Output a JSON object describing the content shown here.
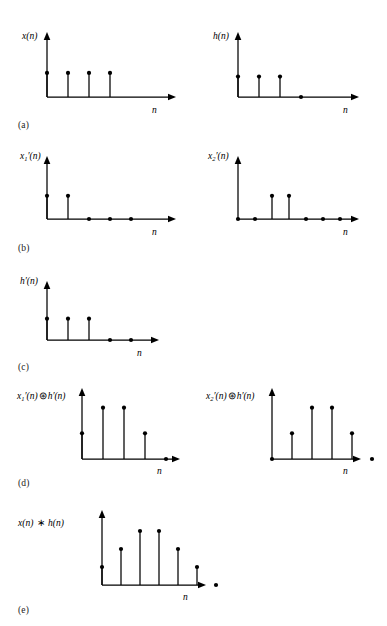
{
  "figure": {
    "axis_label": "n",
    "stem_color": "#000000",
    "background": "#ffffff"
  },
  "panels": [
    {
      "id": "a",
      "label": "(a)",
      "plots": [
        {
          "name": "x(n)",
          "label_html": "x(n)",
          "axis_label": "n",
          "values": [
            1,
            1,
            1,
            1
          ],
          "n_points": 4,
          "ymax": 2.2,
          "zero_markers": []
        },
        {
          "name": "h(n)",
          "label_html": "h(n)",
          "axis_label": "n",
          "values": [
            1,
            1,
            1,
            0
          ],
          "n_points": 4,
          "ymax": 2.6,
          "zero_markers": [
            3
          ]
        }
      ]
    },
    {
      "id": "b",
      "label": "(b)",
      "plots": [
        {
          "name": "x1'(n)",
          "label_html": "x<sub>1</sub>&#8242;(n)",
          "axis_label": "n",
          "values": [
            1,
            1,
            0,
            0,
            0
          ],
          "n_points": 5,
          "ymax": 2.2,
          "zero_markers": [
            2,
            3,
            4
          ]
        },
        {
          "name": "x2'(n)",
          "label_html": "x<sub>2</sub>&#8242;(n)",
          "axis_label": "n",
          "values": [
            0,
            0,
            1,
            1,
            0,
            0,
            0
          ],
          "n_points": 7,
          "ymax": 2.2,
          "zero_markers": [
            0,
            1,
            4,
            5,
            6
          ]
        }
      ]
    },
    {
      "id": "c",
      "label": "(c)",
      "plots": [
        {
          "name": "h'(n)",
          "label_html": "h&#8242;(n)",
          "axis_label": "n",
          "values": [
            1,
            1,
            1,
            0,
            0
          ],
          "n_points": 5,
          "ymax": 2.2,
          "zero_markers": [
            3,
            4
          ]
        }
      ]
    },
    {
      "id": "d",
      "label": "(d)",
      "plots": [
        {
          "name": "x1'(n) circconv h'(n)",
          "label_html": "x<sub>1</sub>&#8242;(n)<span class=\"op\">&#8859;</span>h&#8242;(n)",
          "axis_label": "n",
          "values": [
            1,
            2,
            2,
            1,
            0
          ],
          "n_points": 5,
          "ymax": 2.3,
          "zero_markers": [
            4
          ]
        },
        {
          "name": "x2'(n) circconv h'(n)",
          "label_html": "x<sub>2</sub>&#8242;(n)<span class=\"op\">&#8859;</span>h&#8242;(n)",
          "axis_label": "n",
          "values": [
            0,
            1,
            2,
            2,
            1,
            0
          ],
          "n_points": 6,
          "ymax": 2.3,
          "zero_markers": [
            0,
            5
          ]
        }
      ]
    },
    {
      "id": "e",
      "label": "(e)",
      "plots": [
        {
          "name": "x(n) conv h(n)",
          "label_html": "x(n) <span class=\"op\">&#8727;</span> h(n)",
          "axis_label": "n",
          "values": [
            1,
            2,
            3,
            3,
            2,
            1,
            0
          ],
          "n_points": 7,
          "ymax": 3.5,
          "zero_markers": [
            6
          ]
        }
      ]
    }
  ],
  "chart_data": {
    "type": "stem",
    "xlabel": "n",
    "ylabel": "",
    "grid": false,
    "legend": "none",
    "subplots": [
      {
        "panel": "a",
        "series": "x(n)",
        "x": [
          0,
          1,
          2,
          3
        ],
        "values": [
          1,
          1,
          1,
          1
        ]
      },
      {
        "panel": "a",
        "series": "h(n)",
        "x": [
          0,
          1,
          2,
          3
        ],
        "values": [
          1,
          1,
          1,
          0
        ]
      },
      {
        "panel": "b",
        "series": "x1'(n)",
        "x": [
          0,
          1,
          2,
          3,
          4
        ],
        "values": [
          1,
          1,
          0,
          0,
          0
        ]
      },
      {
        "panel": "b",
        "series": "x2'(n)",
        "x": [
          0,
          1,
          2,
          3,
          4,
          5,
          6
        ],
        "values": [
          0,
          0,
          1,
          1,
          0,
          0,
          0
        ]
      },
      {
        "panel": "c",
        "series": "h'(n)",
        "x": [
          0,
          1,
          2,
          3,
          4
        ],
        "values": [
          1,
          1,
          1,
          0,
          0
        ]
      },
      {
        "panel": "d",
        "series": "x1'(n) ⊛ h'(n)",
        "x": [
          0,
          1,
          2,
          3,
          4
        ],
        "values": [
          1,
          2,
          2,
          1,
          0
        ]
      },
      {
        "panel": "d",
        "series": "x2'(n) ⊛ h'(n)",
        "x": [
          0,
          1,
          2,
          3,
          4,
          5
        ],
        "values": [
          0,
          1,
          2,
          2,
          1,
          0
        ]
      },
      {
        "panel": "e",
        "series": "x(n) ∗ h(n)",
        "x": [
          0,
          1,
          2,
          3,
          4,
          5,
          6
        ],
        "values": [
          1,
          2,
          3,
          3,
          2,
          1,
          0
        ]
      }
    ]
  },
  "layout": {
    "panel_tops": [
      20,
      145,
      270,
      385,
      510
    ],
    "label_tops": [
      120,
      243,
      362,
      478,
      605
    ]
  }
}
